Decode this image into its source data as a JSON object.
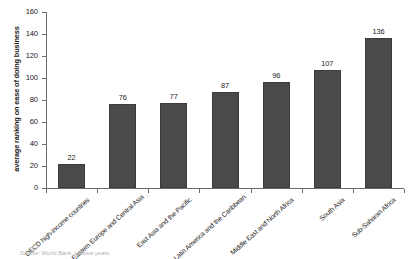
{
  "chart_data": {
    "type": "bar",
    "title": "",
    "xlabel": "",
    "ylabel": "average ranking on ease of doing business",
    "ylim": [
      0,
      160
    ],
    "yticks": [
      0,
      20,
      40,
      60,
      80,
      100,
      120,
      140,
      160
    ],
    "grid": false,
    "legend": null,
    "categories": [
      "OECD high-income countries",
      "Eastern Europe and Central Asia",
      "East Asia and the Pacific",
      "Latin America and the Caribbean",
      "Middle East and North Africa",
      "South Asia",
      "Sub-Saharan Africa"
    ],
    "values": [
      22,
      76,
      77,
      87,
      96,
      107,
      136
    ],
    "bar_color": "#4a4a4a"
  },
  "source": {
    "note": "Source: World Bank, various years."
  }
}
